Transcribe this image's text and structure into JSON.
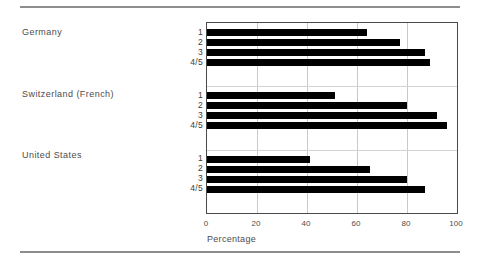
{
  "figure": {
    "background_color": "#ffffff",
    "rule_color": "#8d8d8d",
    "bar_color": "#000000",
    "grid_color": "#c9c9c9",
    "axis_color": "#4a4a4a",
    "text_color": "#4d4d4d"
  },
  "chart_data": {
    "type": "bar",
    "orientation": "horizontal",
    "title": "",
    "subtitle": "",
    "xlabel": "Percentage",
    "ylabel": "",
    "xlim": [
      0,
      100
    ],
    "xticks": [
      0,
      20,
      40,
      60,
      80,
      100
    ],
    "xticklabels": [
      "0",
      "20",
      "40",
      "60",
      "80",
      "100"
    ],
    "grid": "vertical",
    "legend": "none",
    "groups": [
      {
        "name": "Germany",
        "categories": [
          "1",
          "2",
          "3",
          "4/5"
        ],
        "values": [
          64,
          77,
          87,
          89
        ]
      },
      {
        "name": "Switzerland (French)",
        "categories": [
          "1",
          "2",
          "3",
          "4/5"
        ],
        "values": [
          51,
          80,
          92,
          96
        ]
      },
      {
        "name": "United States",
        "categories": [
          "1",
          "2",
          "3",
          "4/5"
        ],
        "values": [
          41,
          65,
          80,
          87
        ]
      }
    ]
  }
}
